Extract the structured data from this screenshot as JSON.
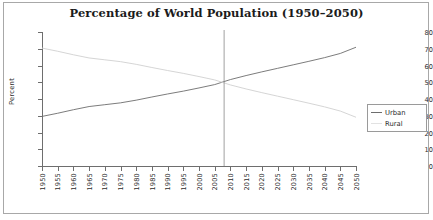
{
  "chart_data": {
    "type": "line",
    "title": "Percentage of World Population (1950–2050)",
    "xlabel": "",
    "ylabel": "Percent",
    "ylim": [
      0,
      80
    ],
    "ytick_step": 10,
    "yticks": [
      "0",
      "10",
      "20",
      "30",
      "40",
      "50",
      "60",
      "70",
      "80"
    ],
    "xlim": [
      1950,
      2050
    ],
    "xtick_step": 5,
    "x": [
      1950,
      1955,
      1960,
      1965,
      1970,
      1975,
      1980,
      1985,
      1990,
      1995,
      2000,
      2005,
      2010,
      2015,
      2020,
      2025,
      2030,
      2035,
      2040,
      2045,
      2050
    ],
    "xticks": [
      "1950",
      "1955",
      "1960",
      "1965",
      "1970",
      "1975",
      "1980",
      "1985",
      "1990",
      "1995",
      "2000",
      "2005",
      "2010",
      "2015",
      "2020",
      "2025",
      "2030",
      "2035",
      "2040",
      "2045",
      "2050"
    ],
    "grid": false,
    "legend_position": "right",
    "series": [
      {
        "name": "Urban",
        "color": "#6d6d6d",
        "values": [
          29.6,
          31.5,
          33.6,
          35.5,
          36.6,
          37.7,
          39.3,
          41.2,
          43.0,
          44.7,
          46.6,
          48.6,
          51.6,
          54.0,
          56.2,
          58.3,
          60.4,
          62.5,
          64.7,
          67.2,
          70.9
        ]
      },
      {
        "name": "Rural",
        "color": "#d0d0d0",
        "values": [
          70.4,
          68.5,
          66.4,
          64.5,
          63.4,
          62.3,
          60.7,
          58.8,
          57.0,
          55.3,
          53.4,
          51.4,
          48.4,
          46.0,
          43.8,
          41.7,
          39.6,
          37.5,
          35.3,
          32.8,
          29.1
        ]
      }
    ],
    "annotations": [
      {
        "name": "crossover-line",
        "type": "vertical-line",
        "x": 2008,
        "color": "#888888"
      }
    ]
  },
  "legend": {
    "items": [
      {
        "label": "Urban",
        "color": "#6d6d6d"
      },
      {
        "label": "Rural",
        "color": "#e2e2e2"
      }
    ]
  }
}
